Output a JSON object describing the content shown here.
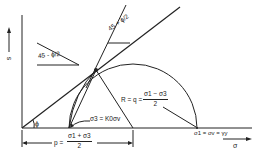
{
  "diagram": {
    "axes": {
      "y_label": "s",
      "x_label": "σ"
    },
    "angles": {
      "phi": "ϕ",
      "upper_angle": "45 + ϕ/2",
      "left_angle": "45 - ϕ/2"
    },
    "labels": {
      "sigma3": "σ3 = K0σv",
      "sigma1": "σ1 = σv = γy",
      "radius_prefix": "R = q =",
      "radius_num": "σ1 − σ3",
      "radius_den": "2",
      "p_prefix": "p =",
      "p_num": "σ1 + σ3",
      "p_den": "2"
    },
    "colors": {
      "line": "#222222",
      "background": "#ffffff"
    }
  }
}
